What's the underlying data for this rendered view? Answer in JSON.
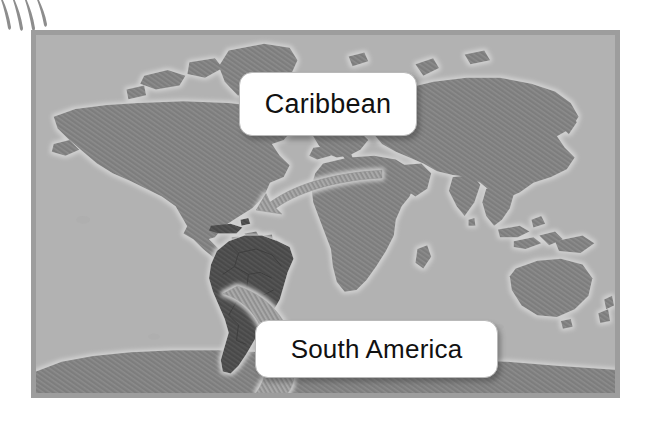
{
  "figure": {
    "type": "world-map-illustration",
    "background_color": "#ffffff"
  },
  "decoration": {
    "name": "claw-strokes",
    "count": 4,
    "color": "#8d8d8d",
    "position": "top-left"
  },
  "map": {
    "frame": {
      "border_color": "#9d9d9d",
      "border_width_px": 5,
      "x": 31,
      "y": 30,
      "width": 589,
      "height": 368
    },
    "ocean_color": "#b2b2b2",
    "land_color": "#7d7d7d",
    "highlight_land_color": "#4a4a4a",
    "coast_halo_color": "#c9c9c9",
    "border_line_color": "#6a6a6a",
    "projection": "equirectangular",
    "highlighted_regions": [
      "South America",
      "Caribbean"
    ]
  },
  "callouts": [
    {
      "id": "caribbean",
      "label": "Caribbean",
      "target_region": "Caribbean",
      "box_color": "#ffffff",
      "text_color": "#111111"
    },
    {
      "id": "south-america",
      "label": "South America",
      "target_region": "South America",
      "box_color": "#ffffff",
      "text_color": "#111111"
    }
  ],
  "leaders": [
    {
      "name": "caribbean-leader-arrow",
      "style": "hatched-tapered-arrow",
      "from": "caribbean-callout-left",
      "to": "caribbean-islands",
      "has_arrowhead": true
    },
    {
      "name": "south-america-leader",
      "style": "hatched-tapered-band",
      "from": "south-america-callout-left",
      "to": "south-america-continent",
      "has_arrowhead": false
    }
  ]
}
